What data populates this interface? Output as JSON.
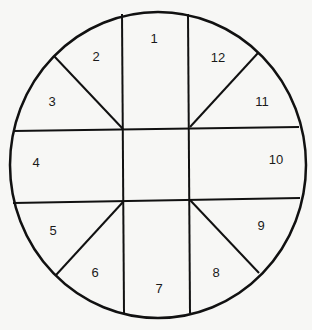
{
  "diagram": {
    "shape": "circle divided into 12 numbered segments",
    "stroke_color": "#111111",
    "background": "#f7f7f5",
    "segments": [
      {
        "id": 1,
        "label": "1",
        "x": 154,
        "y": 40
      },
      {
        "id": 2,
        "label": "2",
        "x": 96,
        "y": 58
      },
      {
        "id": 3,
        "label": "3",
        "x": 52,
        "y": 103
      },
      {
        "id": 4,
        "label": "4",
        "x": 36,
        "y": 164
      },
      {
        "id": 5,
        "label": "5",
        "x": 53,
        "y": 232
      },
      {
        "id": 6,
        "label": "6",
        "x": 95,
        "y": 274
      },
      {
        "id": 7,
        "label": "7",
        "x": 159,
        "y": 290
      },
      {
        "id": 8,
        "label": "8",
        "x": 216,
        "y": 274
      },
      {
        "id": 9,
        "label": "9",
        "x": 261,
        "y": 227
      },
      {
        "id": 10,
        "label": "10",
        "x": 276,
        "y": 161
      },
      {
        "id": 11,
        "label": "11",
        "x": 262,
        "y": 103
      },
      {
        "id": 12,
        "label": "12",
        "x": 218,
        "y": 59
      }
    ]
  }
}
